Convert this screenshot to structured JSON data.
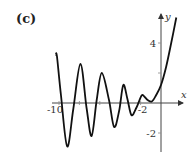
{
  "panel_label": "(c)",
  "chart_data": {
    "type": "line",
    "title": "",
    "xlabel": "x",
    "ylabel": "y",
    "xlim": [
      -10.5,
      2
    ],
    "ylim": [
      -3,
      5.8
    ],
    "grid": false,
    "x_ticks": [
      {
        "value": -10,
        "label": "-10"
      },
      {
        "value": -8,
        "label": ""
      },
      {
        "value": -6,
        "label": ""
      },
      {
        "value": -4,
        "label": ""
      },
      {
        "value": -2,
        "label": "-2"
      }
    ],
    "y_ticks": [
      {
        "value": 4,
        "label": "4"
      },
      {
        "value": 2,
        "label": ""
      },
      {
        "value": -2,
        "label": "-2"
      }
    ],
    "series": [
      {
        "name": "f(x)",
        "x": [
          -10.3,
          -10.2,
          -9.8,
          -9.2,
          -8.6,
          -7.9,
          -7.3,
          -6.8,
          -6.3,
          -5.8,
          -5.1,
          -4.6,
          -4.1,
          -3.7,
          -3.3,
          -2.9,
          -2.4,
          -1.9,
          -1.6,
          -1.3,
          -0.9,
          -0.5,
          0,
          0.5,
          1.0,
          1.5
        ],
        "y": [
          3.2,
          3.1,
          0.5,
          -2.9,
          -0.4,
          2.6,
          -0.3,
          -2.2,
          0.2,
          2.0,
          0.2,
          -1.6,
          -0.5,
          1.2,
          0.3,
          -0.8,
          -0.3,
          0.5,
          0.4,
          0.2,
          0.1,
          0.5,
          1.2,
          2.4,
          4.0,
          5.7
        ]
      }
    ]
  }
}
